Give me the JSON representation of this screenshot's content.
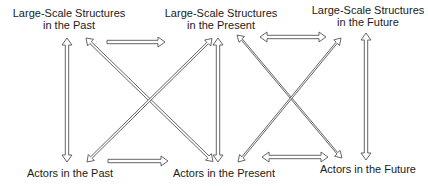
{
  "diagram": {
    "nodes": {
      "structures_past": {
        "line1": "Large-Scale Structures",
        "line2": "in the Past"
      },
      "structures_present": {
        "line1": "Large-Scale Structures",
        "line2": "in the Present"
      },
      "structures_future": {
        "line1": "Large-Scale Structures",
        "line2": "in the Future"
      },
      "actors_past": {
        "line1": "Actors in the Past"
      },
      "actors_present": {
        "line1": "Actors in the Present"
      },
      "actors_future": {
        "line1": "Actors in the Future"
      }
    },
    "edges": [
      {
        "from": "structures_past",
        "to": "actors_past",
        "type": "bidirectional"
      },
      {
        "from": "structures_past",
        "to": "structures_present",
        "type": "unidirectional"
      },
      {
        "from": "structures_past",
        "to": "actors_present",
        "type": "bidirectional"
      },
      {
        "from": "actors_past",
        "to": "structures_present",
        "type": "bidirectional"
      },
      {
        "from": "actors_past",
        "to": "actors_present",
        "type": "unidirectional"
      },
      {
        "from": "structures_present",
        "to": "actors_present",
        "type": "bidirectional"
      },
      {
        "from": "structures_present",
        "to": "structures_future",
        "type": "bidirectional"
      },
      {
        "from": "structures_present",
        "to": "actors_future",
        "type": "bidirectional"
      },
      {
        "from": "actors_present",
        "to": "structures_future",
        "type": "bidirectional"
      },
      {
        "from": "actors_present",
        "to": "actors_future",
        "type": "bidirectional"
      },
      {
        "from": "structures_future",
        "to": "actors_future",
        "type": "bidirectional"
      }
    ],
    "colors": {
      "arrow_stroke": "#555555",
      "arrow_fill": "#ffffff",
      "text": "#1a1a1a"
    }
  }
}
